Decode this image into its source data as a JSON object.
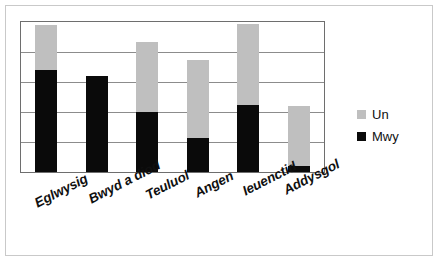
{
  "chart_data": {
    "type": "bar",
    "subtype": "stacked-vertical",
    "title": "",
    "subtitle": "",
    "xlabel": "",
    "ylabel": "",
    "ylim": [
      0,
      5
    ],
    "grid": true,
    "gridlines": [
      0,
      1,
      2,
      3,
      4,
      5
    ],
    "y_tick_labels": [],
    "legend_position": "right",
    "categories": [
      "Eglwysig",
      "Bwyd a diod",
      "Teuluol",
      "Angen",
      "Ieuenctid",
      "Addysgol"
    ],
    "series": [
      {
        "name": "Mwy",
        "color": "#0a0a0a",
        "values": [
          3.4,
          3.2,
          2.0,
          1.15,
          2.25,
          0.2
        ]
      },
      {
        "name": "Un",
        "color": "#bfbfbf",
        "values": [
          1.5,
          0.0,
          2.35,
          2.6,
          2.7,
          2.0
        ]
      }
    ],
    "totals": [
      4.9,
      3.2,
      4.35,
      3.75,
      4.95,
      2.2
    ]
  },
  "legend": {
    "items": [
      {
        "label": "Un",
        "color": "#bfbfbf",
        "swatch": "legend-swatch-un"
      },
      {
        "label": "Mwy",
        "color": "#0a0a0a",
        "swatch": "legend-swatch-mwy"
      }
    ]
  },
  "axis": {
    "categories": [
      {
        "label": "Eglwysig"
      },
      {
        "label": "Bwyd a diod"
      },
      {
        "label": "Teuluol"
      },
      {
        "label": "Angen"
      },
      {
        "label": "Ieuenctid"
      },
      {
        "label": "Addysgol"
      }
    ]
  },
  "colors": {
    "series_un": "#bfbfbf",
    "series_mwy": "#0a0a0a",
    "gridline": "#8c8c8c",
    "plot_border": "#6e6e6e",
    "figure_border": "#c9c9c9",
    "background": "#ffffff",
    "text": "#101010"
  }
}
